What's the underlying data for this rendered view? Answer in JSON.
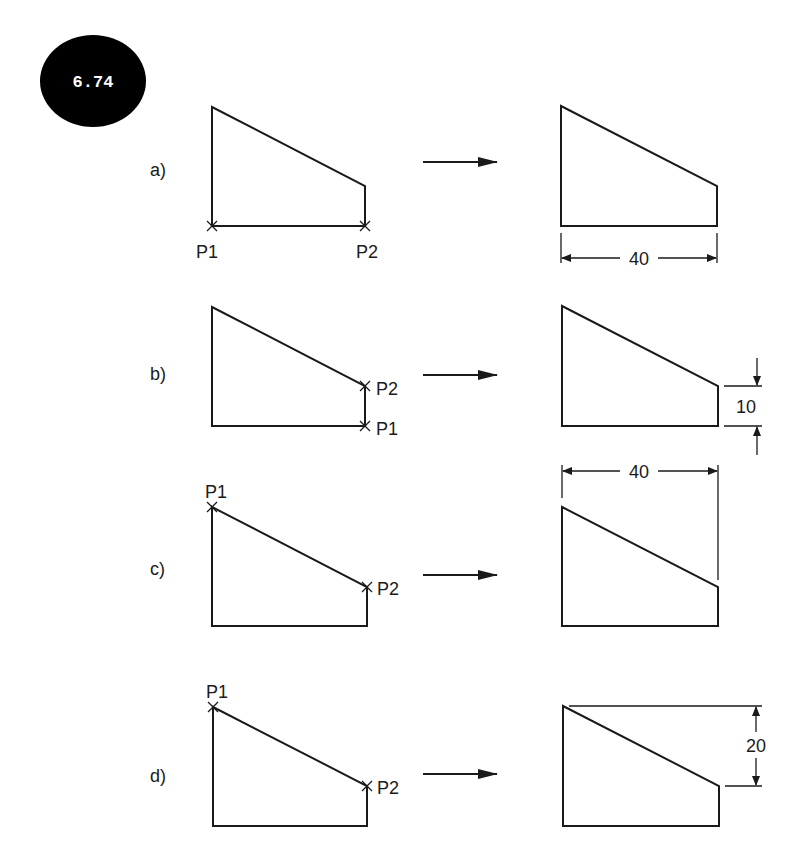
{
  "badge": {
    "text": "6.74",
    "color": "#000000"
  },
  "rows": [
    {
      "label": "a)",
      "points": {
        "p1": "P1",
        "p2": "P2"
      },
      "dimension": "40"
    },
    {
      "label": "b)",
      "points": {
        "p1": "P1",
        "p2": "P2"
      },
      "dimension": "10"
    },
    {
      "label": "c)",
      "points": {
        "p1": "P1",
        "p2": "P2"
      },
      "dimension": "40"
    },
    {
      "label": "d)",
      "points": {
        "p1": "P1",
        "p2": "P2"
      },
      "dimension": "20"
    }
  ]
}
